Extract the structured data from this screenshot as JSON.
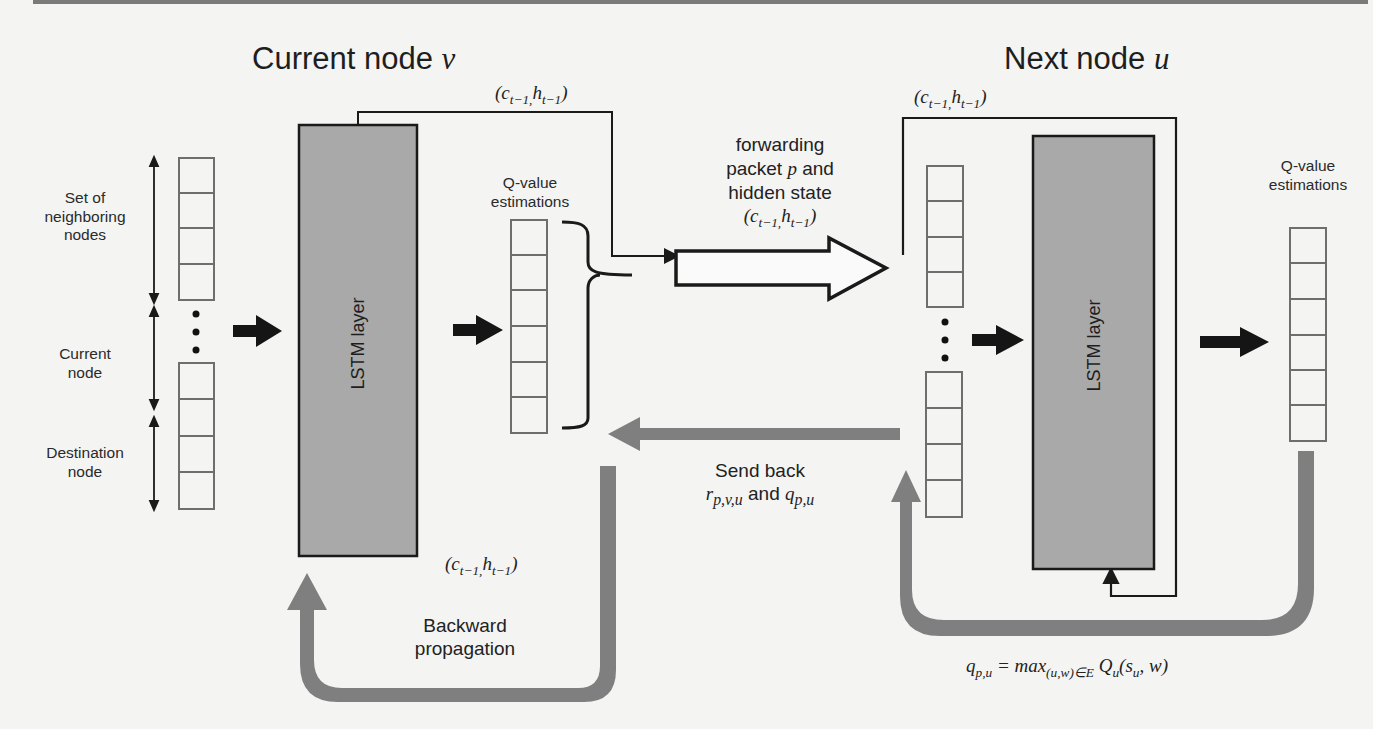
{
  "diagram": {
    "left_title": "Current node",
    "left_title_var": "v",
    "right_title": "Next node",
    "right_title_var": "u",
    "hidden_state_label": "(c",
    "hidden_state": {
      "c": "c",
      "c_sub": "t−1,",
      "h": "h",
      "h_sub": "t−1"
    },
    "input_labels": {
      "neighbors": "Set of neighboring nodes",
      "current": "Current node",
      "destination": "Destination node"
    },
    "lstm_label": "LSTM layer",
    "qvalue_label_line1": "Q-value",
    "qvalue_label_line2": "estimations",
    "forward_label_line1": "forwarding",
    "forward_label_line2_a": "packet ",
    "forward_label_line2_var": "p",
    "forward_label_line2_b": " and",
    "forward_label_line3": "hidden state",
    "sendback_line1": "Send back",
    "sendback_r": "r",
    "sendback_r_sub": "p,v,u",
    "sendback_and": " and ",
    "sendback_q": "q",
    "sendback_q_sub": "p,u",
    "backprop_line1": "Backward",
    "backprop_line2": "propagation",
    "equation": {
      "lhs": "q",
      "lhs_sub": "p,u",
      "eq": " = max",
      "max_sub": "(u,w)∈E",
      "Q": " Q",
      "Q_sub": "u",
      "args_open": "(s",
      "s_sub": "u",
      "args_close": ", w)"
    },
    "colors": {
      "lstm_fill": "#a9a9a9",
      "feedback_arrow": "#7f7f7f",
      "cell_border": "#6e6e6e",
      "line": "#1a1a1a"
    }
  }
}
